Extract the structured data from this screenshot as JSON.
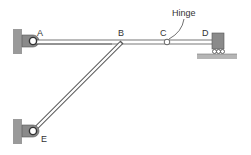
{
  "diagram": {
    "type": "structural-frame",
    "labels": {
      "A": "A",
      "B": "B",
      "C": "C",
      "D": "D",
      "E": "E",
      "hinge": "Hinge"
    },
    "colors": {
      "member_stroke": "#555555",
      "member_fill": "#ffffff",
      "support_fill": "#8a8a8a",
      "wall_fill": "#9a9a9a",
      "ground_fill": "#b5b5b5",
      "text": "#333333"
    },
    "nodes": [
      {
        "id": "A",
        "support": "pin (wall bracket)"
      },
      {
        "id": "B",
        "support": "joint"
      },
      {
        "id": "C",
        "support": "internal hinge"
      },
      {
        "id": "D",
        "support": "roller"
      },
      {
        "id": "E",
        "support": "pin (wall bracket)"
      }
    ],
    "members": [
      {
        "from": "A",
        "to": "B"
      },
      {
        "from": "B",
        "to": "C"
      },
      {
        "from": "C",
        "to": "D"
      },
      {
        "from": "E",
        "to": "B"
      }
    ]
  }
}
